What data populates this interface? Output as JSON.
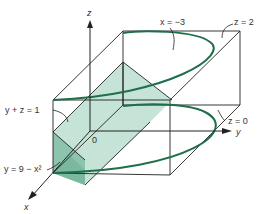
{
  "figure": {
    "axes": {
      "x": "x",
      "y": "y",
      "z": "z",
      "origin": "0"
    },
    "labels": {
      "plane_x": "x = −3",
      "plane_z2": "z = 2",
      "plane_z0": "z = 0",
      "plane_yz": "y + z = 1",
      "surface": "y = 9 − x²"
    },
    "colors": {
      "curve": "#1f6f4a",
      "fill_light": "#bfe0d2",
      "fill_dark": "#8cc4ad",
      "lines": "#222222"
    }
  }
}
